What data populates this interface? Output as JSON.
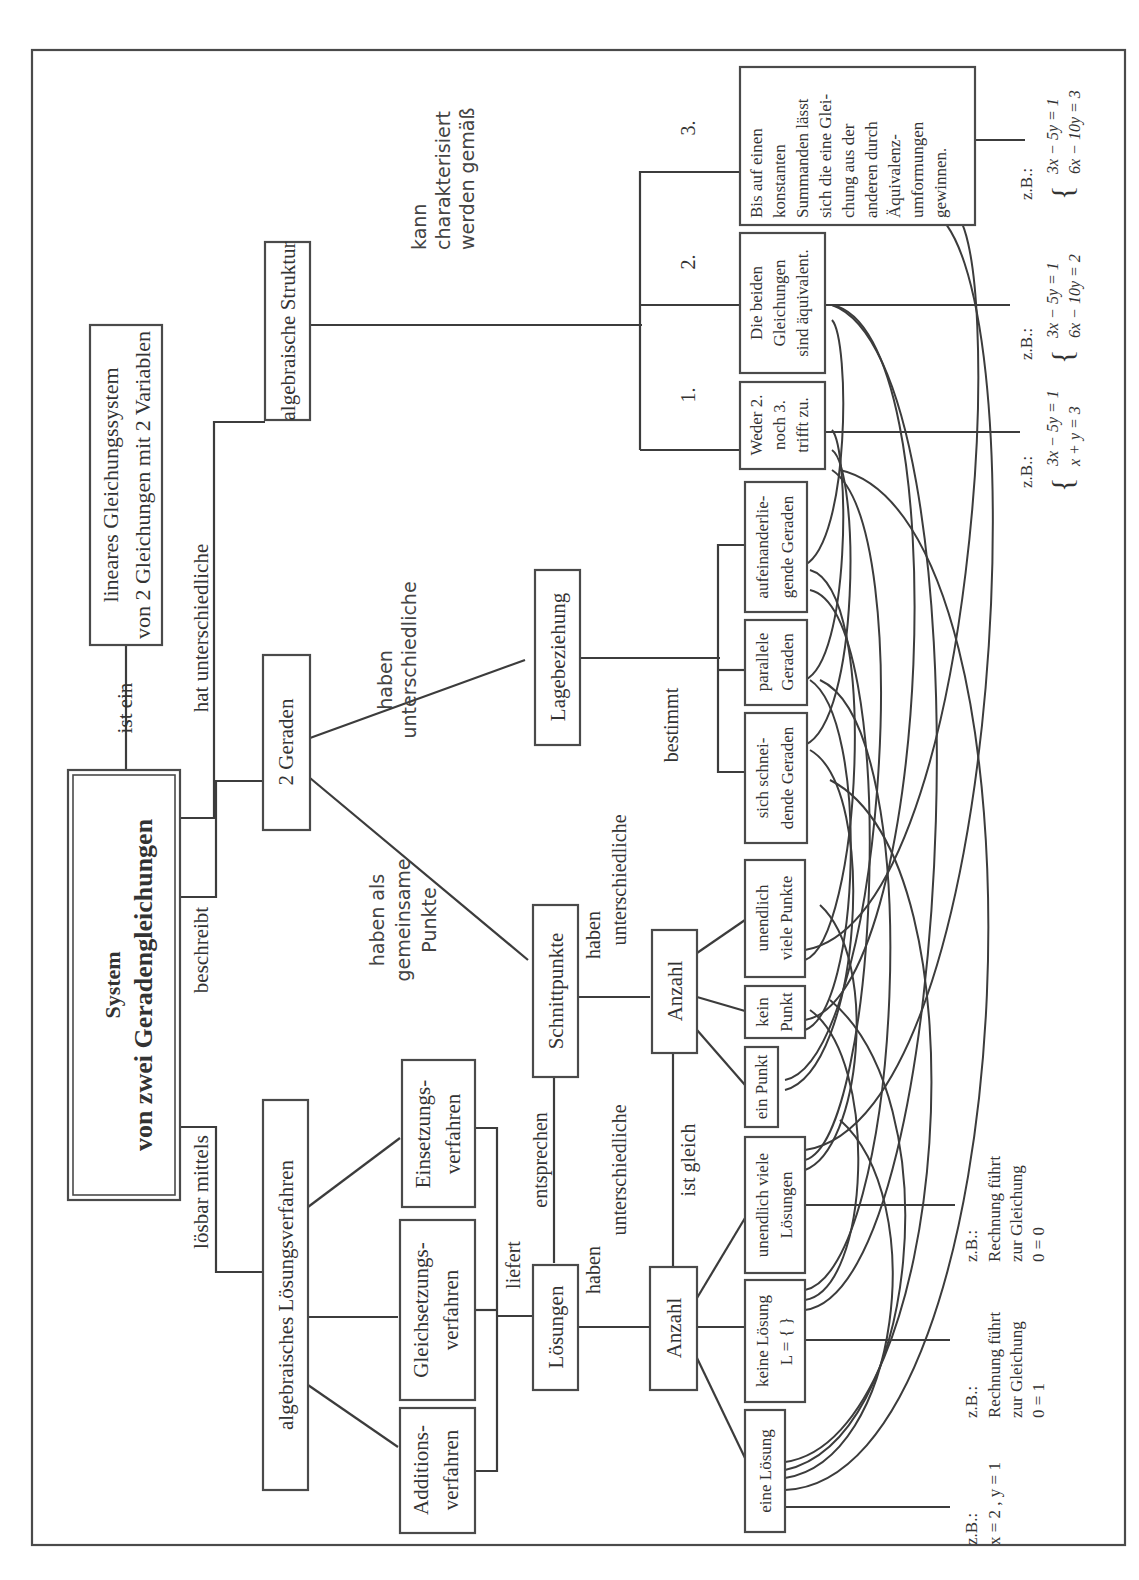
{
  "diagram": {
    "type": "concept-map",
    "orientation": "rotated -90deg",
    "central_node": {
      "line1": "System",
      "line2": "von zwei Geradengleichungen"
    },
    "nodes": {
      "lgs": {
        "line1": "lineares Gleichungssystem",
        "line2": "von 2 Gleichungen mit 2 Variablen"
      },
      "algebraische_struktur": {
        "label": "algebraische Struktur"
      },
      "zwei_geraden": {
        "label": "2 Geraden"
      },
      "lagebeziehung": {
        "label": "Lagebeziehung"
      },
      "schnittpunkte": {
        "label": "Schnittpunkte"
      },
      "anzahl_punkte": {
        "label": "Anzahl"
      },
      "loesungsverfahren": {
        "label": "algebraisches Lösungsverfahren"
      },
      "additionsverfahren": {
        "line1": "Additions-",
        "line2": "verfahren"
      },
      "gleichsetzungsverfahren": {
        "line1": "Gleichsetzungs-",
        "line2": "verfahren"
      },
      "einsetzungsverfahren": {
        "line1": "Einsetzungs-",
        "line2": "verfahren"
      },
      "loesungen": {
        "label": "Lösungen"
      },
      "anzahl_loesungen": {
        "label": "Anzahl"
      },
      "eine_loesung": {
        "label": "eine Lösung"
      },
      "keine_loesung": {
        "line1": "keine Lösung",
        "line2": "L = { }"
      },
      "unendlich_loesungen": {
        "line1": "unendlich viele",
        "line2": "Lösungen"
      },
      "ein_punkt": {
        "label": "ein Punkt"
      },
      "kein_punkt": {
        "line1": "kein",
        "line2": "Punkt"
      },
      "unendlich_punkte": {
        "line1": "unendlich",
        "line2": "viele Punkte"
      },
      "schneidende": {
        "line1": "sich schnei-",
        "line2": "dende Geraden"
      },
      "parallele": {
        "line1": "parallele",
        "line2": "Geraden"
      },
      "aufeinander": {
        "line1": "aufeinanderlie-",
        "line2": "gende Geraden"
      },
      "weder": {
        "line1": "Weder 2.",
        "line2": "noch 3.",
        "line3": "trifft zu."
      },
      "aequivalent": {
        "line1": "Die beiden",
        "line2": "Gleichungen",
        "line3": "sind äquivalent."
      },
      "konstant": {
        "lines": [
          "Bis auf einen",
          "konstanten",
          "Summanden lässt",
          "sich die eine Glei-",
          "chung aus der",
          "anderen durch",
          "Äquivalenz-",
          "umformungen",
          "gewinnen."
        ]
      }
    },
    "edge_labels": {
      "ist_ein": "ist ein",
      "hat_unterschiedliche": "hat unterschiedliche",
      "beschreibt": "beschreibt",
      "loesbar_mittels": "lösbar mittels",
      "kann_char": [
        "kann",
        "charakterisiert",
        "werden gemäß"
      ],
      "num1": "1.",
      "num2": "2.",
      "num3": "3.",
      "haben_unterschiedliche_top": [
        "haben",
        "unterschiedliche"
      ],
      "haben_gemeinsame": [
        "haben als",
        "gemeinsame",
        "Punkte"
      ],
      "bestimmt": "bestimmt",
      "haben_unterschiedliche_mid": [
        "haben",
        "unterschiedliche"
      ],
      "entsprechen": "entsprechen",
      "ist_gleich": "ist gleich",
      "liefert": "liefert",
      "haben_unterschiedliche_low": [
        "haben",
        "unterschiedliche"
      ]
    },
    "examples": {
      "eine_loesung": {
        "zb": "z.B.:",
        "text": "x = 2 , y = 1"
      },
      "keine_loesung": {
        "zb": "z.B.:",
        "lines": [
          "Rechnung führt",
          "zur Gleichung",
          "0 = 1"
        ]
      },
      "unendlich_loesungen": {
        "zb": "z.B.:",
        "lines": [
          "Rechnung führt",
          "zur Gleichung",
          "0 = 0"
        ]
      },
      "weder": {
        "zb": "z.B.:",
        "eq1": "3x − 5y = 1",
        "eq2": "x + y = 3"
      },
      "aequivalent": {
        "zb": "z.B.:",
        "eq1": "3x − 5y = 1",
        "eq2": "6x − 10y = 2"
      },
      "konstant": {
        "zb": "z.B.:",
        "eq1": "3x − 5y = 1",
        "eq2": "6x − 10y = 3"
      }
    },
    "colors": {
      "stroke": "#3c3c3c",
      "text": "#333333",
      "background": "#ffffff"
    }
  }
}
